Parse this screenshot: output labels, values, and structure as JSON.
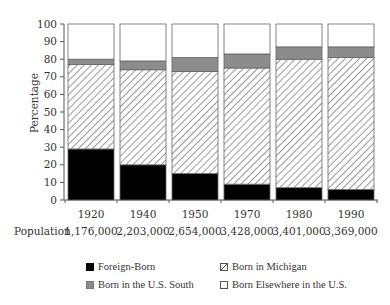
{
  "chart_data": {
    "type": "bar",
    "stacked": true,
    "title": "",
    "xlabel": "",
    "ylabel": "Percentage",
    "ylim": [
      0,
      100
    ],
    "yticks": [
      0,
      10,
      20,
      30,
      40,
      50,
      60,
      70,
      80,
      90,
      100
    ],
    "categories": [
      "1920",
      "1940",
      "1950",
      "1970",
      "1980",
      "1990"
    ],
    "population_label": "Population",
    "population": [
      "1,176,000",
      "2,203,000",
      "2,654,000",
      "3,428,000",
      "3,401,000",
      "3,369,000"
    ],
    "series": [
      {
        "name": "Foreign-Born",
        "fill": "#000000",
        "pattern": "solid",
        "values": [
          29,
          20,
          15,
          9,
          7,
          6
        ]
      },
      {
        "name": "Born in Michigan",
        "fill": "#ffffff",
        "pattern": "hatch",
        "values": [
          48,
          54,
          58,
          66,
          73,
          75
        ]
      },
      {
        "name": "Born in the U.S. South",
        "fill": "#8c8c8c",
        "pattern": "solid",
        "values": [
          3,
          5,
          8,
          8,
          7,
          6
        ]
      },
      {
        "name": "Born Elsewhere in the U.S.",
        "fill": "#ffffff",
        "pattern": "solid",
        "values": [
          20,
          21,
          19,
          17,
          13,
          13
        ]
      }
    ],
    "grid": false,
    "legend_position": "bottom"
  },
  "legend": {
    "items": [
      {
        "label": "Foreign-Born",
        "swatch": "black"
      },
      {
        "label": "Born in Michigan",
        "swatch": "hatch"
      },
      {
        "label": "Born in the U.S. South",
        "swatch": "gray"
      },
      {
        "label": "Born Elsewhere in the U.S.",
        "swatch": "white"
      }
    ]
  }
}
